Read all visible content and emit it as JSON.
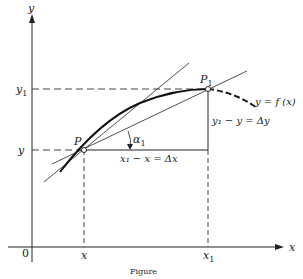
{
  "figure": {
    "axes": {
      "x_label": "x",
      "y_label": "y",
      "origin_label": "0"
    },
    "points": {
      "P": {
        "label": "P",
        "x_label": "x",
        "y_label": "y"
      },
      "P1": {
        "label": "P",
        "subscript": "1",
        "x_label_base": "x",
        "x_label_sub": "1",
        "y_label_base": "y",
        "y_label_sub": "1"
      }
    },
    "annotations": {
      "curve": "y = f (x)",
      "delta_y": "y₁ − y = Δy",
      "delta_x": "x₁ − x = Δx",
      "angle_base": "α",
      "angle_sub": "1"
    },
    "caption": "Figure"
  }
}
